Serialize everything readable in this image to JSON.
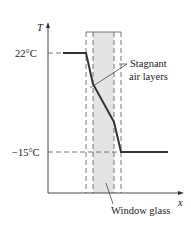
{
  "diagram": {
    "axes": {
      "y_label": "T",
      "x_label": "x"
    },
    "temperatures": {
      "high": "22°C",
      "low": "−15°C"
    },
    "annotations": {
      "air_line1": "Stagnant",
      "air_line2": "air layers",
      "glass": "Window glass"
    },
    "colors": {
      "glass_fill": "#e4e4e4",
      "line": "#333333",
      "dash": "#555555"
    }
  }
}
